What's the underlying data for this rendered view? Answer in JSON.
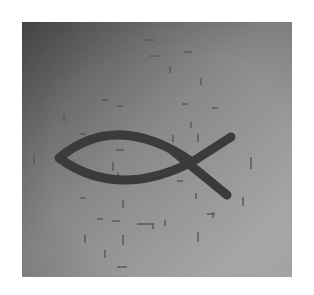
{
  "image": {
    "subject": "ichthys-fish-symbol",
    "frame": {
      "x": 22,
      "y": 22,
      "width": 270,
      "height": 255
    },
    "colors": {
      "page_background": "#ffffff",
      "gradient_top_left": "#4e4e4e",
      "gradient_mid": "#8c8c8c",
      "gradient_bottom_right": "#b4b4b4",
      "fish": "#3b3b3b",
      "marks": "#5a5a5a"
    },
    "fish": {
      "nose": [
        37,
        136
      ],
      "top_control": [
        95,
        88
      ],
      "crossing": [
        170,
        140
      ],
      "bottom_control": [
        95,
        178
      ],
      "upper_tail_tip": [
        209,
        115
      ],
      "lower_tail_tip": [
        205,
        173
      ],
      "stroke_width": 9
    },
    "marks": [
      [
        122,
        17,
        10,
        2
      ],
      [
        128,
        33,
        9,
        2
      ],
      [
        162,
        29,
        8,
        2
      ],
      [
        147,
        44,
        2,
        7
      ],
      [
        178,
        56,
        2,
        7
      ],
      [
        80,
        77,
        6,
        2
      ],
      [
        95,
        83,
        6,
        2
      ],
      [
        41,
        92,
        2,
        8
      ],
      [
        58,
        111,
        6,
        2
      ],
      [
        160,
        81,
        6,
        2
      ],
      [
        190,
        85,
        6,
        2
      ],
      [
        168,
        100,
        2,
        6
      ],
      [
        150,
        113,
        2,
        7
      ],
      [
        175,
        112,
        2,
        8
      ],
      [
        11,
        132,
        2,
        10
      ],
      [
        94,
        127,
        8,
        2
      ],
      [
        90,
        140,
        2,
        9
      ],
      [
        95,
        150,
        2,
        6
      ],
      [
        228,
        135,
        2,
        12
      ],
      [
        155,
        158,
        6,
        2
      ],
      [
        173,
        171,
        2,
        6
      ],
      [
        58,
        175,
        6,
        2
      ],
      [
        100,
        178,
        2,
        8
      ],
      [
        220,
        175,
        2,
        9
      ],
      [
        190,
        190,
        2,
        6
      ],
      [
        75,
        196,
        6,
        2
      ],
      [
        90,
        198,
        8,
        2
      ],
      [
        115,
        201,
        16,
        2
      ],
      [
        130,
        201,
        2,
        6
      ],
      [
        142,
        198,
        2,
        6
      ],
      [
        62,
        213,
        2,
        8
      ],
      [
        100,
        213,
        2,
        10
      ],
      [
        175,
        210,
        2,
        10
      ],
      [
        185,
        191,
        8,
        2
      ],
      [
        82,
        228,
        2,
        8
      ],
      [
        95,
        244,
        10,
        2
      ]
    ]
  }
}
